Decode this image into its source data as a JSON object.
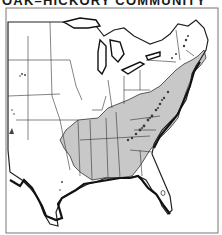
{
  "map": {
    "title": "OAK–HICKORY COMMUNITY",
    "subject": "Distribution of the oak–hickory forest community in the eastern United States",
    "legend_colors": {
      "community_range": "#c8c8c8",
      "outside_range": "#ffffff",
      "borders": "#222222",
      "mountain_highlands": "#3a3a3a"
    },
    "regions_shaded": [
      "Missouri",
      "Arkansas",
      "Kentucky",
      "Tennessee",
      "Ohio",
      "Indiana",
      "Illinois",
      "West Virginia",
      "Virginia",
      "Pennsylvania",
      "North Carolina",
      "South Carolina",
      "Georgia",
      "Alabama",
      "Mississippi",
      "Louisiana",
      "Maryland",
      "New Jersey",
      "New York",
      "Connecticut",
      "Massachusetts"
    ],
    "frame": "bordered"
  }
}
